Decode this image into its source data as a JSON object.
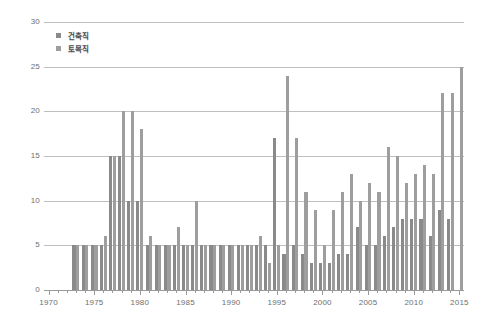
{
  "chart_data": {
    "type": "bar",
    "title": "",
    "subtitle": "",
    "xlabel": "",
    "ylabel": "",
    "xlim": [
      1970,
      2015
    ],
    "ylim": [
      0,
      30
    ],
    "yticks": [
      0,
      5,
      10,
      15,
      20,
      25,
      30
    ],
    "xticks": [
      1970,
      1975,
      1980,
      1985,
      1990,
      1995,
      2000,
      2005,
      2010,
      2015
    ],
    "xtick_labels": [
      "1970",
      "1975",
      "1980",
      "1985",
      "1990",
      "1995",
      "2000",
      "2005",
      "2010",
      "2015"
    ],
    "ytick_labels": [
      "0",
      "5",
      "10",
      "15",
      "20",
      "25",
      "30"
    ],
    "grid": true,
    "grid_axis": "y",
    "legend_position": "top-left",
    "legend": [
      "건축직",
      "토목직"
    ],
    "categories": [
      1970,
      1971,
      1972,
      1973,
      1974,
      1975,
      1976,
      1977,
      1978,
      1979,
      1980,
      1981,
      1982,
      1983,
      1984,
      1985,
      1986,
      1987,
      1988,
      1989,
      1990,
      1991,
      1992,
      1993,
      1994,
      1995,
      1996,
      1997,
      1998,
      1999,
      2000,
      2001,
      2002,
      2003,
      2004,
      2005,
      2006,
      2007,
      2008,
      2009,
      2010,
      2011,
      2012,
      2013,
      2014,
      2015
    ],
    "series": [
      {
        "name": "건축직",
        "color": "#8a8a8a",
        "values": [
          0,
          0,
          0,
          5,
          5,
          5,
          5,
          15,
          15,
          10,
          10,
          5,
          5,
          5,
          5,
          5,
          5,
          5,
          5,
          5,
          5,
          5,
          5,
          5,
          5,
          17,
          4,
          5,
          4,
          3,
          3,
          3,
          4,
          4,
          7,
          5,
          5,
          6,
          7,
          8,
          8,
          8,
          6,
          9,
          8,
          0
        ]
      },
      {
        "name": "토목직",
        "color": "#9e9e9e",
        "values": [
          0,
          0,
          0,
          5,
          5,
          5,
          6,
          15,
          20,
          20,
          18,
          6,
          5,
          5,
          7,
          5,
          10,
          5,
          5,
          5,
          5,
          5,
          5,
          6,
          3,
          5,
          24,
          17,
          11,
          9,
          5,
          9,
          11,
          13,
          10,
          12,
          11,
          16,
          15,
          12,
          13,
          14,
          13,
          22,
          22,
          25
        ]
      }
    ]
  },
  "legend": {
    "items": [
      {
        "label": "건축직",
        "swatch": "#8a8a8a"
      },
      {
        "label": "토목직",
        "swatch": "#9e9e9e"
      }
    ]
  },
  "axes": {
    "y_labels": [
      "30",
      "25",
      "20",
      "15",
      "10",
      "5",
      "0"
    ],
    "x_labels": [
      "1970",
      "1975",
      "1980",
      "1985",
      "1990",
      "1995",
      "2000",
      "2005",
      "2010",
      "2015"
    ]
  }
}
